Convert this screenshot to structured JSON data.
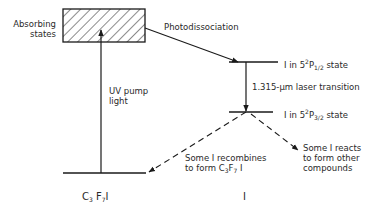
{
  "diagram": {
    "labels": {
      "absorbing_states": [
        "Absorbing",
        "states"
      ],
      "photodissociation": "Photodissociation",
      "upper_state": {
        "prefix": "I in 5",
        "sup": "2",
        "mid": "P",
        "sub": "1/2",
        "suffix": " state"
      },
      "laser_transition": "1.315-μm laser transition",
      "lower_state": {
        "prefix": "I in 5",
        "sup": "2",
        "mid": "P",
        "sub": "3/2",
        "suffix": " state"
      },
      "uv_pump": [
        "UV pump",
        "light"
      ],
      "recombines": {
        "line1": "Some I recombines",
        "line2_prefix": "to form C",
        "line2_sub1": "3",
        "line2_mid": "F",
        "line2_sub2": "7",
        "line2_suffix": " I"
      },
      "reacts": [
        "Some I reacts",
        "to form other",
        "compounds"
      ],
      "molecule_axis": {
        "prefix": "C",
        "sub1": "3",
        "mid": " F",
        "sub2": "7",
        "suffix": "I"
      },
      "iodine_axis": "I"
    },
    "colors": {
      "line": "#1a1a1a",
      "text": "#2a2a2a",
      "background": "#ffffff"
    }
  }
}
